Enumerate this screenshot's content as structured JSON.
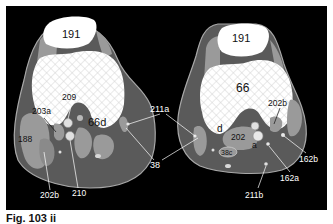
{
  "figure": {
    "caption": "Fig. 103 ii",
    "background": "#000000",
    "colors": {
      "bone": "#ffffff",
      "soft_tissue_dark": "#5a5a5a",
      "muscle_light": "#9a9a9a",
      "outline": "#b0b0b0",
      "label_text_on_dark": "#ffffff",
      "label_text_on_light": "#111111"
    }
  },
  "left_section": {
    "labels": {
      "patella": "191",
      "femur_condyle": "66d",
      "label_209": "209",
      "label_203a": "203a",
      "label_188": "188",
      "label_202b": "202b",
      "label_210": "210"
    }
  },
  "right_section": {
    "labels": {
      "patella": "191",
      "femur": "66",
      "label_202b": "202b",
      "label_d": "d",
      "label_202": "202",
      "label_a": "a",
      "label_38c": "38c",
      "label_162b": "162b",
      "label_162a": "162a",
      "label_211b": "211b"
    }
  },
  "shared_labels": {
    "label_211a": "211a",
    "label_38": "38"
  }
}
